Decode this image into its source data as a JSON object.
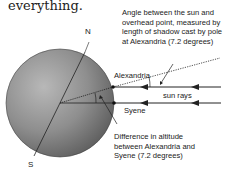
{
  "heading": "everything.",
  "diagram": {
    "labels": {
      "north": "N",
      "south": "S",
      "alexandria": "Alexandria",
      "syene": "Syene",
      "sun_rays": "sun rays"
    },
    "annotations": {
      "angle_sun": [
        "Angle between the sun and",
        "overhead point, measured by",
        "length of shadow cast by pole",
        "at Alexandria (7.2 degrees)"
      ],
      "altitude_diff": [
        "Difference in altitude",
        "between Alexandria and",
        "Syene (7.2 degrees)"
      ]
    },
    "angle_degrees": 7.2
  }
}
